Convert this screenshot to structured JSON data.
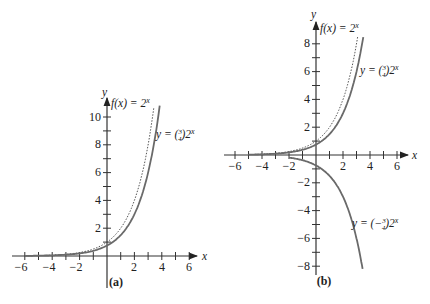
{
  "chart_data": [
    {
      "type": "line",
      "panel": "(a)",
      "title": "",
      "xlabel": "x",
      "ylabel": "y",
      "xlim": [
        -6.5,
        6.5
      ],
      "ylim": [
        0,
        11
      ],
      "x_ticks": [
        -6,
        -4,
        -2,
        2,
        4,
        6
      ],
      "y_ticks": [
        2,
        4,
        6,
        8,
        10
      ],
      "series": [
        {
          "name": "f(x) = 2^x",
          "style": "dotted",
          "function": "2^x",
          "x_range": [
            -6,
            3.42
          ],
          "points": [
            [
              -6,
              0.016
            ],
            [
              -4,
              0.0625
            ],
            [
              -2,
              0.25
            ],
            [
              0,
              1
            ],
            [
              1,
              2
            ],
            [
              2,
              4
            ],
            [
              3,
              8
            ],
            [
              3.42,
              10.7
            ]
          ]
        },
        {
          "name": "y = (3/4)2^x",
          "style": "solid",
          "function": "0.75*2^x",
          "x_range": [
            -6,
            3.85
          ],
          "points": [
            [
              -6,
              0.012
            ],
            [
              -4,
              0.047
            ],
            [
              -2,
              0.1875
            ],
            [
              0,
              0.75
            ],
            [
              1,
              1.5
            ],
            [
              2,
              3
            ],
            [
              3,
              6
            ],
            [
              3.85,
              10.8
            ]
          ]
        }
      ]
    },
    {
      "type": "line",
      "panel": "(b)",
      "title": "",
      "xlabel": "x",
      "ylabel": "y",
      "xlim": [
        -6.5,
        6.5
      ],
      "ylim": [
        -8.5,
        8.5
      ],
      "x_ticks": [
        -6,
        -4,
        -2,
        2,
        4,
        6
      ],
      "y_ticks": [
        -8,
        -6,
        -4,
        -2,
        2,
        4,
        6,
        8
      ],
      "series": [
        {
          "name": "f(x) = 2^x",
          "style": "dotted",
          "function": "2^x",
          "x_range": [
            -5,
            3.09
          ],
          "points": [
            [
              -5,
              0.031
            ],
            [
              -2,
              0.25
            ],
            [
              0,
              1
            ],
            [
              1,
              2
            ],
            [
              2,
              4
            ],
            [
              3,
              8
            ],
            [
              3.09,
              8.5
            ]
          ]
        },
        {
          "name": "y = (3/4)2^x",
          "style": "solid",
          "function": "0.75*2^x",
          "x_range": [
            -5,
            3.5
          ],
          "points": [
            [
              -5,
              0.023
            ],
            [
              -2,
              0.1875
            ],
            [
              0,
              0.75
            ],
            [
              1,
              1.5
            ],
            [
              2,
              3
            ],
            [
              3,
              6
            ],
            [
              3.5,
              8.5
            ]
          ]
        },
        {
          "name": "y = (−3/4)2^x",
          "style": "solid",
          "function": "-0.75*2^x",
          "x_range": [
            -2,
            3.45
          ],
          "points": [
            [
              -2,
              -0.1875
            ],
            [
              0,
              -0.75
            ],
            [
              1,
              -1.5
            ],
            [
              2,
              -3
            ],
            [
              3,
              -6
            ],
            [
              3.45,
              -8.2
            ]
          ]
        }
      ]
    }
  ],
  "panels": {
    "a": {
      "caption": "(a)",
      "x_axis_label": "x",
      "y_axis_label": "y",
      "x_tick_labels": [
        "−6",
        "−4",
        "−2",
        "2",
        "4",
        "6"
      ],
      "y_tick_labels": [
        "2",
        "4",
        "6",
        "8",
        "10"
      ],
      "label_f": "f(x) = 2",
      "label_f_exp": "x",
      "label_g_prefix": "y = (",
      "label_g_num": "3",
      "label_g_den": "4",
      "label_g_suffix": ")2",
      "label_g_exp": "x"
    },
    "b": {
      "caption": "(b)",
      "x_axis_label": "x",
      "y_axis_label": "y",
      "x_tick_labels": [
        "−6",
        "−4",
        "−2",
        "2",
        "4",
        "6"
      ],
      "y_tick_labels": [
        "8",
        "6",
        "4",
        "2",
        "−2",
        "−4",
        "−6",
        "−8"
      ],
      "label_f": "f(x) = 2",
      "label_f_exp": "x",
      "label_g_prefix": "y = (",
      "label_g_num": "3",
      "label_g_den": "4",
      "label_g_suffix": ")2",
      "label_g_exp": "x",
      "label_h_prefix": "y = (−",
      "label_h_num": "3",
      "label_h_den": "4",
      "label_h_suffix": ")2",
      "label_h_exp": "x"
    }
  }
}
